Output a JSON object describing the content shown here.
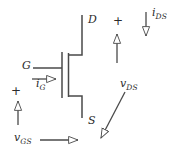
{
  "figure": {
    "type": "circuit-diagram",
    "device": "n-channel MOSFET",
    "stroke_color": "#4a4a4a",
    "text_color": "#2b2b2b",
    "background": "#ffffff"
  },
  "terminals": {
    "drain": {
      "label": "D",
      "x": 88,
      "y": 14
    },
    "source": {
      "label": "S",
      "x": 88,
      "y": 115
    },
    "gate": {
      "label": "G",
      "x": 22,
      "y": 60
    }
  },
  "currents": [
    {
      "id": "i_G",
      "base": "i",
      "subscript": "G",
      "direction": "right",
      "label_x": 36,
      "label_y": 78
    },
    {
      "id": "i_DS",
      "base": "i",
      "subscript": "DS",
      "direction": "down",
      "label_x": 152,
      "label_y": 7
    }
  ],
  "voltages": [
    {
      "id": "v_GS",
      "base": "v",
      "subscript": "GS",
      "polarity": "+",
      "arrow_direction": "right",
      "label_x": 14,
      "label_y": 132,
      "plus_x": 11,
      "plus_y": 85
    },
    {
      "id": "v_DS",
      "base": "v",
      "subscript": "DS",
      "polarity": "+",
      "arrow_direction": "down-left",
      "label_x": 120,
      "label_y": 78,
      "plus_x": 113,
      "plus_y": 15
    }
  ],
  "arrowhead_style": "hollow-open-triangle"
}
